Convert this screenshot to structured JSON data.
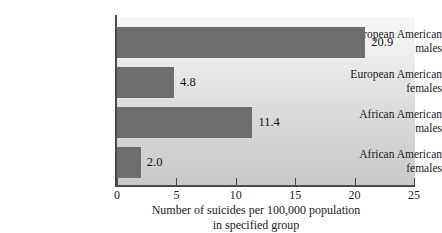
{
  "chart_data": {
    "type": "bar",
    "orientation": "horizontal",
    "title": "",
    "xlabel": "Number of suicides per 100,000 population in specified group",
    "xlabel_lines": [
      "Number of suicides per 100,000 population",
      "in specified group"
    ],
    "ylabel": "",
    "categories": [
      "European American males",
      "European American females",
      "African American males",
      "African American females"
    ],
    "category_lines": [
      [
        "European American",
        "males"
      ],
      [
        "European American",
        "females"
      ],
      [
        "African American",
        "males"
      ],
      [
        "African American",
        "females"
      ]
    ],
    "values": [
      20.9,
      11.4,
      4.8,
      2.0
    ],
    "value_labels": [
      "20.9",
      "4.8",
      "11.4",
      "2.0"
    ],
    "bars": [
      {
        "label_line1": "European American",
        "label_line2": "males",
        "value": 20.9,
        "value_label": "20.9"
      },
      {
        "label_line1": "European American",
        "label_line2": "females",
        "value": 4.8,
        "value_label": "4.8"
      },
      {
        "label_line1": "African American",
        "label_line2": "males",
        "value": 11.4,
        "value_label": "11.4"
      },
      {
        "label_line1": "African American",
        "label_line2": "females",
        "value": 2.0,
        "value_label": "2.0"
      }
    ],
    "xlim": [
      0,
      25
    ],
    "xticks": [
      0,
      5,
      10,
      15,
      20,
      25
    ],
    "xtick_labels": [
      "0",
      "5",
      "10",
      "15",
      "20",
      "25"
    ],
    "grid": false,
    "legend": null,
    "colors": {
      "bar": "#6e6e6e",
      "plot_background_top": "#f8f8f8",
      "plot_background_bottom": "#c9c9c9",
      "axis": "#4a4a4a",
      "text": "#1a1a1a",
      "page_background": "#ffffff"
    }
  }
}
